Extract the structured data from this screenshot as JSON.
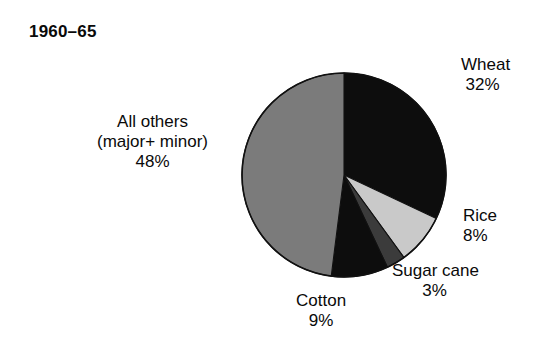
{
  "chart_data": {
    "type": "pie",
    "title": "1960–65",
    "subtitle": "",
    "xlabel": "",
    "ylabel": "",
    "grid": false,
    "legend": "none",
    "labels_position": "outside",
    "start_angle_deg": 0,
    "direction": "clockwise",
    "total_percent": 100,
    "categories": [
      "Wheat",
      "Rice",
      "Sugar cane",
      "Cotton",
      "All others (major+ minor)"
    ],
    "values": [
      32,
      8,
      3,
      9,
      48
    ],
    "slices": [
      {
        "name": "Wheat",
        "value": 32,
        "pct_label": "32%",
        "color": "#0d0d0d",
        "start_deg": 0,
        "end_deg": 115.2
      },
      {
        "name": "Rice",
        "value": 8,
        "pct_label": "8%",
        "color": "#c9c9c9",
        "start_deg": 115.2,
        "end_deg": 144.0
      },
      {
        "name": "Sugar cane",
        "value": 3,
        "pct_label": "3%",
        "color": "#3b3b3b",
        "start_deg": 144.0,
        "end_deg": 154.8
      },
      {
        "name": "Cotton",
        "value": 9,
        "pct_label": "9%",
        "color": "#0d0d0d",
        "start_deg": 154.8,
        "end_deg": 187.2
      },
      {
        "name": "All others (major+ minor)",
        "value": 48,
        "pct_label": "48%",
        "color": "#7b7b7b",
        "start_deg": 187.2,
        "end_deg": 360.0
      }
    ]
  },
  "title": {
    "text": "1960–65"
  },
  "labels": {
    "wheat": {
      "name": "Wheat",
      "pct": "32%"
    },
    "rice": {
      "name": "Rice",
      "pct": "8%"
    },
    "sugarcane": {
      "name": "Sugar cane",
      "pct": "3%"
    },
    "cotton": {
      "name": "Cotton",
      "pct": "9%"
    },
    "allothers": {
      "line1": "All others",
      "line2": "(major+ minor)",
      "pct": "48%"
    }
  },
  "colors": {
    "background": "#ffffff",
    "text": "#0a0a0a",
    "outline": "#111111",
    "wheat": "#0d0d0d",
    "rice": "#c9c9c9",
    "sugarcane": "#3b3b3b",
    "cotton": "#0d0d0d",
    "allothers": "#7b7b7b"
  }
}
